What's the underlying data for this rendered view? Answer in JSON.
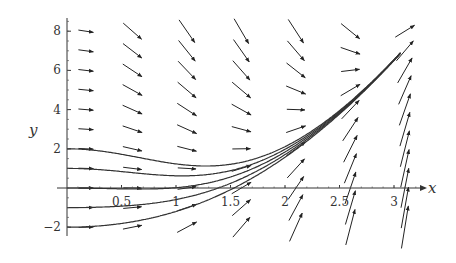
{
  "chart_data": {
    "type": "direction_field",
    "title": "",
    "xlabel": "x",
    "ylabel": "y",
    "xlim": [
      0,
      3.2
    ],
    "ylim": [
      -2.2,
      8.5
    ],
    "grid": false,
    "legend": null,
    "x_ticks": [
      {
        "value": 0.5,
        "label": "0.5"
      },
      {
        "value": 1,
        "label": "1"
      },
      {
        "value": 1.5,
        "label": "1.5"
      },
      {
        "value": 2,
        "label": "2"
      },
      {
        "value": 2.5,
        "label": "2.5"
      },
      {
        "value": 3,
        "label": "3"
      }
    ],
    "y_ticks": [
      {
        "value": -2,
        "label": "−2"
      },
      {
        "value": 2,
        "label": "2"
      },
      {
        "value": 4,
        "label": "4"
      },
      {
        "value": 6,
        "label": "6"
      },
      {
        "value": 8,
        "label": "8"
      }
    ],
    "field": {
      "description": "slope field dy/dx = x*(x^2 - 0.5 - y) (approximate reading)",
      "coef_a": 1.0,
      "coef_b": -0.5,
      "arrow_columns_x": [
        0.1,
        0.6,
        1.1,
        1.6,
        2.1,
        2.6,
        3.1
      ],
      "arrow_rows_y": [
        -2,
        -1,
        0,
        1,
        2,
        3,
        4,
        5,
        6,
        7,
        8
      ]
    },
    "solution_curves": [
      {
        "y0": 2,
        "x_start": 0,
        "x_end": 3.05
      },
      {
        "y0": 1,
        "x_start": 0,
        "x_end": 3.05
      },
      {
        "y0": 0,
        "x_start": 0,
        "x_end": 3.05
      },
      {
        "y0": -1,
        "x_start": 0,
        "x_end": 3.05
      },
      {
        "y0": -2,
        "x_start": 0,
        "x_end": 3.05
      }
    ],
    "colors": {
      "arrow": "#222222",
      "curve": "#333333",
      "axis": "#333333"
    }
  }
}
